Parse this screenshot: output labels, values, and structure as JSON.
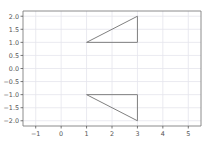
{
  "chart_data": {
    "type": "line",
    "title": "",
    "xlabel": "",
    "ylabel": "",
    "xlim": [
      -1.5,
      5.5
    ],
    "ylim": [
      -2.2,
      2.2
    ],
    "grid": true,
    "legend": null,
    "xticks": [
      -1,
      0,
      1,
      2,
      3,
      4,
      5
    ],
    "xticklabels": [
      "−1",
      "0",
      "1",
      "2",
      "3",
      "4",
      "5"
    ],
    "yticks": [
      -2.0,
      -1.5,
      -1.0,
      -0.5,
      0.0,
      0.5,
      1.0,
      1.5,
      2.0
    ],
    "yticklabels": [
      "−2.0",
      "−1.5",
      "−1.0",
      "−0.5",
      "0.0",
      "0.5",
      "1.0",
      "1.5",
      "2.0"
    ],
    "series": [
      {
        "name": "upper-triangle",
        "x": [
          1,
          3,
          3,
          1
        ],
        "y": [
          1,
          2,
          1,
          1
        ],
        "color": "#808080",
        "linewidth": 1.0,
        "closed": true
      },
      {
        "name": "lower-triangle",
        "x": [
          1,
          3,
          3,
          1
        ],
        "y": [
          -1,
          -1,
          -2,
          -1
        ],
        "color": "#808080",
        "linewidth": 1.0,
        "closed": true
      }
    ]
  },
  "style": {
    "figure_facecolor": "#ffffff",
    "axes_facecolor": "#ffffff",
    "grid_color": "#e4e4ec",
    "spine_color": "#808080",
    "tick_color": "#555555",
    "line_color": "#808080"
  }
}
